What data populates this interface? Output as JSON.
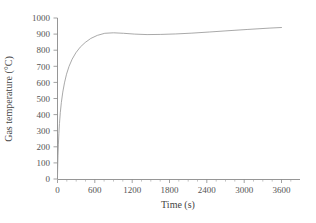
{
  "chart_data": {
    "type": "line",
    "title": "",
    "subtitle": "",
    "xlabel": "Time (s)",
    "ylabel": "Gas temperature (°C)",
    "xlim": [
      0,
      3900
    ],
    "ylim": [
      0,
      1000
    ],
    "xticks": [
      0,
      600,
      1200,
      1800,
      2400,
      3000,
      3600
    ],
    "xticklabels": [
      "0",
      "600",
      "1200",
      "1800",
      "2400",
      "3000",
      "3600"
    ],
    "yticks": [
      0,
      100,
      200,
      300,
      400,
      500,
      600,
      700,
      800,
      900,
      1000
    ],
    "yticklabels": [
      "0",
      "100",
      "200",
      "300",
      "400",
      "500",
      "600",
      "700",
      "800",
      "900",
      "1000"
    ],
    "x_minor_tick_interval": 150,
    "y_minor_ticks": false,
    "grid": false,
    "legend": false,
    "legend_position": "none",
    "series": [
      {
        "name": "Gas temperature",
        "color": "#9a9a9a",
        "x": [
          0,
          5,
          10,
          20,
          30,
          45,
          60,
          90,
          120,
          150,
          180,
          240,
          300,
          360,
          420,
          480,
          540,
          600,
          720,
          840,
          960,
          1080,
          1200,
          1380,
          1560,
          1800,
          2040,
          2280,
          2400,
          2640,
          2880,
          3120,
          3360,
          3600
        ],
        "y": [
          20,
          104,
          170,
          266,
          334,
          412,
          472,
          560,
          622,
          669,
          707,
          765,
          809,
          844,
          873,
          897,
          919,
          937,
          969,
          995,
          1017,
          1036,
          1053,
          1075,
          1094,
          1116,
          1135,
          1151,
          1159,
          1172,
          1184,
          1195,
          1205,
          1214
        ]
      }
    ],
    "curve_rendered": {
      "comment": "points actually drawn, clipped to the 0-1000 axis window",
      "x": [
        0,
        4,
        8,
        14,
        22,
        32,
        45,
        62,
        85,
        112,
        145,
        185,
        235,
        295,
        365,
        445,
        535,
        640,
        760,
        900,
        1060,
        1240,
        1440,
        1660,
        1900,
        2160,
        2440,
        2740,
        3060,
        3400,
        3600
      ],
      "y": [
        20,
        92,
        148,
        212,
        282,
        345,
        412,
        476,
        540,
        597,
        651,
        699,
        744,
        784,
        819,
        848,
        873,
        892,
        905,
        908,
        905,
        900,
        897,
        898,
        901,
        906,
        913,
        921,
        929,
        937,
        941
      ]
    },
    "final_value": 940
  },
  "axes": {
    "x_title": "Time (s)",
    "y_title": "Gas temperature (°C)"
  }
}
